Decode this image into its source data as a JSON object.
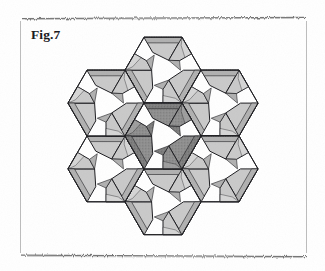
{
  "page": {
    "width": 325,
    "height": 271,
    "background_color": "#ffffff",
    "kind": "scanned-book-page-figure"
  },
  "border": {
    "name": "scanned-page-frame",
    "left_x": 20,
    "right_x": 307,
    "top_y": 18,
    "bottom_y": 256,
    "color": "#8a8a8a",
    "style": "hairline-rule-with-ragged-scan-edges"
  },
  "caption": {
    "label": "Fig.7",
    "x": 31,
    "y": 27,
    "font_style": "bold-serif",
    "color": "#16161a"
  },
  "figure": {
    "name": "hexagonal-pinwheel-tessellation-rosette",
    "center": {
      "x": 163,
      "y": 136
    },
    "unit_circumradius": 38,
    "unit_spacing": 65.8,
    "unit_count": 7,
    "units": [
      {
        "name": "unit-center",
        "cx": 163.0,
        "cy": 136.0,
        "tone": "dark",
        "rotation": 0
      },
      {
        "name": "unit-top",
        "cx": 163.0,
        "cy": 70.2,
        "tone": "light",
        "rotation": 0
      },
      {
        "name": "unit-upper-right",
        "cx": 220.0,
        "cy": 103.1,
        "tone": "light",
        "rotation": 0
      },
      {
        "name": "unit-lower-right",
        "cx": 220.0,
        "cy": 168.9,
        "tone": "light",
        "rotation": 0
      },
      {
        "name": "unit-bottom",
        "cx": 163.0,
        "cy": 201.8,
        "tone": "light",
        "rotation": 0
      },
      {
        "name": "unit-lower-left",
        "cx": 106.0,
        "cy": 168.9,
        "tone": "light",
        "rotation": 0
      },
      {
        "name": "unit-upper-left",
        "cx": 106.0,
        "cy": 103.1,
        "tone": "light",
        "rotation": 0
      }
    ],
    "colors": {
      "outline": "#1b1b1f",
      "flap_light_face": "#c9c9c9",
      "flap_light_shade": "#b0b0b0",
      "flap_light_edge": "#dcdcdc",
      "flap_dark_face": "#8e8e8e",
      "flap_dark_shade": "#7a7a7a",
      "flap_dark_edge": "#a6a6a6",
      "void": "#ffffff",
      "dotted_crease": "#2a2a2a"
    },
    "line_weights": {
      "outline": 1.0,
      "crease": 0.6
    }
  }
}
